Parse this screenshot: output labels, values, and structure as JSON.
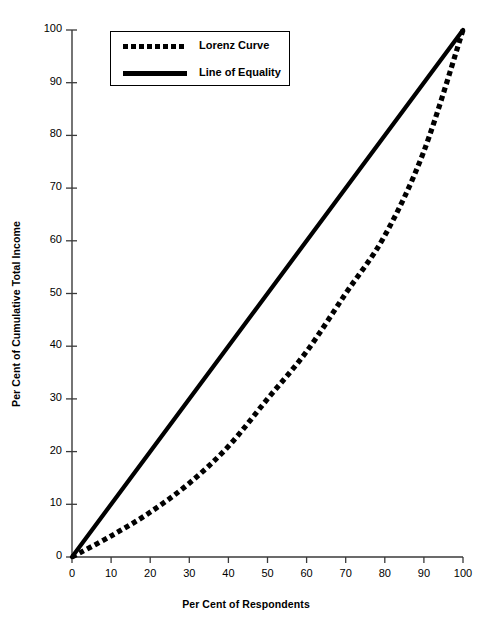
{
  "chart_data": {
    "type": "line",
    "title": "",
    "xlabel": "Per Cent of Respondents",
    "ylabel": "Per Cent of Cumulative Total Income",
    "xlim": [
      0,
      100
    ],
    "ylim": [
      0,
      100
    ],
    "xticks": [
      0,
      10,
      20,
      30,
      40,
      50,
      60,
      70,
      80,
      90,
      100
    ],
    "yticks": [
      0,
      10,
      20,
      30,
      40,
      50,
      60,
      70,
      80,
      90,
      100
    ],
    "grid": false,
    "legend_position": "top-left",
    "series": [
      {
        "name": "Lorenz Curve",
        "style": "dotted",
        "color": "#000000",
        "x": [
          0,
          10,
          20,
          30,
          40,
          50,
          60,
          70,
          80,
          90,
          100
        ],
        "values": [
          0,
          4,
          8.5,
          14,
          21,
          30,
          39,
          50,
          61,
          77,
          100
        ]
      },
      {
        "name": "Line of Equality",
        "style": "solid",
        "color": "#000000",
        "x": [
          0,
          100
        ],
        "values": [
          0,
          100
        ]
      }
    ]
  },
  "legend": {
    "items": [
      {
        "label": "Lorenz Curve",
        "swatch": "dotted"
      },
      {
        "label": "Line of Equality",
        "swatch": "solid"
      }
    ]
  },
  "axis": {
    "x_title": "Per Cent of Respondents",
    "y_title": "Per Cent of Cumulative Total Income"
  }
}
